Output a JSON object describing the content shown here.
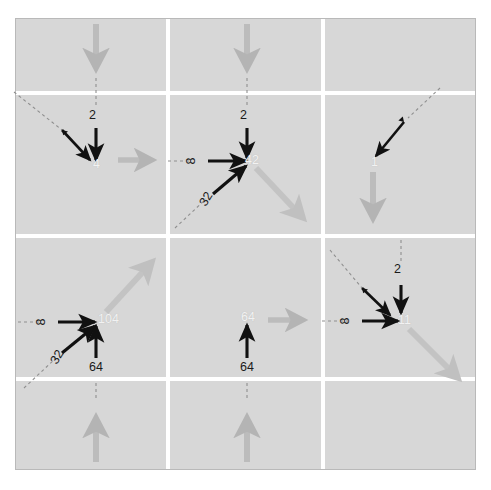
{
  "figure": {
    "type": "diagram",
    "title": "",
    "background_color": "#ffffff",
    "grid_fill_color": "#d7d7d7",
    "gridline_color": "#ffffff",
    "frame_border_color": "#b9b9b9",
    "black_arrow_color": "#111111",
    "gray_arrow_color": "#b4b4b4",
    "dashed_guide_color": "#8f8f8f",
    "center_value_color": "#f2f2f2",
    "label_color": "#1a1a1a",
    "rows": 3,
    "cols": 3
  },
  "cells": [
    {
      "id": "cell-r1c1",
      "row": 1,
      "col": 1,
      "center_value": "",
      "incoming_labels": [],
      "gray_arrows": [],
      "note": "empty upper-left corner cell"
    },
    {
      "id": "cell-r1c2",
      "row": 1,
      "col": 2,
      "center_value": "",
      "incoming_labels": [],
      "gray_arrows": [
        "down"
      ],
      "note": "gray arrow pointing down into row 2"
    },
    {
      "id": "cell-r1c3",
      "row": 1,
      "col": 3,
      "center_value": "",
      "incoming_labels": [],
      "gray_arrows": [
        "down"
      ],
      "note": "gray arrow pointing down into row 2"
    },
    {
      "id": "cell-r2c1",
      "row": 2,
      "col": 1,
      "center_value": "4",
      "incoming_labels": [
        {
          "value": "2",
          "direction": "down",
          "orientation": "horizontal-text"
        }
      ],
      "gray_arrows": [
        "right"
      ],
      "note": "black vertical arrow labelled 2 plus unlabelled diagonal from upper-left"
    },
    {
      "id": "cell-r2c2",
      "row": 2,
      "col": 2,
      "center_value": "42",
      "incoming_labels": [
        {
          "value": "2",
          "direction": "down",
          "orientation": "horizontal-text"
        },
        {
          "value": "8",
          "direction": "right",
          "orientation": "rotated-90"
        },
        {
          "value": "32",
          "direction": "up-right",
          "orientation": "rotated-diagonal"
        }
      ],
      "gray_arrows": [
        "down-right"
      ],
      "note": "three black input arrows converge; gray resultant leaves down-right"
    },
    {
      "id": "cell-r2c3",
      "row": 2,
      "col": 3,
      "center_value": "1",
      "incoming_labels": [],
      "gray_arrows": [
        "down"
      ],
      "note": "black diagonal arrow in from upper-right; gray arrow exits downward"
    },
    {
      "id": "cell-r3c1",
      "row": 3,
      "col": 1,
      "center_value": "104",
      "incoming_labels": [
        {
          "value": "8",
          "direction": "right",
          "orientation": "rotated-90"
        },
        {
          "value": "32",
          "direction": "up-right",
          "orientation": "rotated-diagonal"
        },
        {
          "value": "64",
          "direction": "up",
          "orientation": "horizontal-text"
        }
      ],
      "gray_arrows": [
        "up-right"
      ],
      "note": "three black input arrows converge; gray resultant leaves up-right"
    },
    {
      "id": "cell-r3c2",
      "row": 3,
      "col": 2,
      "center_value": "64",
      "incoming_labels": [
        {
          "value": "64",
          "direction": "up",
          "orientation": "horizontal-text"
        }
      ],
      "gray_arrows": [
        "right"
      ],
      "note": "single vertical black arrow labelled 64; gray arrow exits right"
    },
    {
      "id": "cell-r3c3",
      "row": 3,
      "col": 3,
      "center_value": "11",
      "incoming_labels": [
        {
          "value": "2",
          "direction": "down",
          "orientation": "horizontal-text"
        },
        {
          "value": "8",
          "direction": "right",
          "orientation": "rotated-90"
        }
      ],
      "gray_arrows": [
        "down-right"
      ],
      "note": "two labelled black arrows plus diagonal from upper-left; gray resultant down-right"
    },
    {
      "id": "cell-r4c1",
      "row": 4,
      "col": 1,
      "center_value": "",
      "incoming_labels": [],
      "gray_arrows": [
        "up"
      ],
      "note": "bottom band gray arrow pointing up"
    },
    {
      "id": "cell-r4c2",
      "row": 4,
      "col": 2,
      "center_value": "",
      "incoming_labels": [],
      "gray_arrows": [
        "up"
      ],
      "note": "bottom band gray arrow pointing up"
    },
    {
      "id": "cell-r4c3",
      "row": 4,
      "col": 3,
      "center_value": "",
      "incoming_labels": [],
      "gray_arrows": [],
      "note": "empty lower-right corner cell"
    }
  ],
  "labels": {
    "two_a": "2",
    "two_b": "2",
    "two_c": "2",
    "eight_a": "8",
    "eight_b": "8",
    "eight_c": "8",
    "thirtytwo_a": "32",
    "thirtytwo_b": "32",
    "sixtyfour_a": "64",
    "sixtyfour_b": "64"
  },
  "center_values": {
    "r2c1": "4",
    "r2c2": "42",
    "r2c3": "1",
    "r3c1": "104",
    "r3c2": "64",
    "r3c3": "11"
  }
}
